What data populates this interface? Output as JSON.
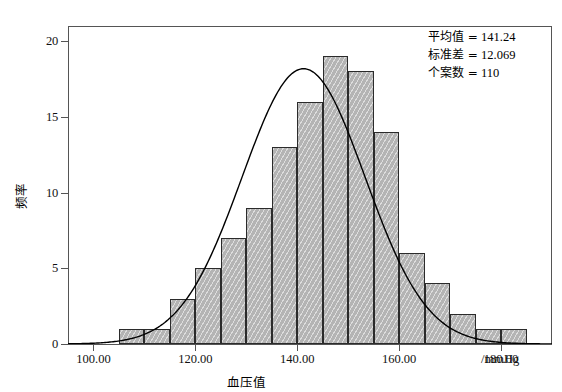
{
  "chart_data": {
    "type": "bar",
    "title": "",
    "subtitle": "",
    "xlabel": "血压值",
    "x_unit_label": "/mmHg",
    "ylabel": "频率",
    "xlim": [
      95,
      190
    ],
    "ylim": [
      0,
      21
    ],
    "grid": false,
    "x_ticks": [
      "100.00",
      "120.00",
      "140.00",
      "160.00",
      "180.00"
    ],
    "x_tick_values": [
      100,
      120,
      140,
      160,
      180
    ],
    "y_ticks": [
      "0",
      "5",
      "10",
      "15",
      "20"
    ],
    "y_tick_values": [
      0,
      5,
      10,
      15,
      20
    ],
    "bin_width": 5,
    "bin_edges": [
      105,
      110,
      115,
      120,
      125,
      130,
      135,
      140,
      145,
      150,
      155,
      160,
      165,
      170,
      175,
      180,
      185
    ],
    "categories": [
      "105-110",
      "110-115",
      "115-120",
      "120-125",
      "125-130",
      "130-135",
      "135-140",
      "140-145",
      "145-150",
      "150-155",
      "155-160",
      "160-165",
      "165-170",
      "170-175",
      "175-180",
      "180-185"
    ],
    "values": [
      1,
      1,
      3,
      5,
      7,
      9,
      13,
      16,
      19,
      18,
      14,
      6,
      4,
      2,
      1,
      1
    ],
    "bar_fill_color": "#b4b4b4",
    "bar_edge_color": "#2b2b2b",
    "curve": {
      "type": "normal",
      "mean": 141.24,
      "sd": 12.069,
      "n": 110,
      "scale_bin_width": 5,
      "peak_value": 18.2,
      "color": "#000000"
    },
    "legend_position": "top-right",
    "annotations": [
      "平均值 = 141.24",
      "标准差 = 12.069",
      "个案数 = 110"
    ]
  },
  "stats": {
    "mean_label": "平均值 =",
    "mean_value": "141.24",
    "sd_label": "标准差 =",
    "sd_value": "12.069",
    "n_label": "个案数 =",
    "n_value": "110"
  },
  "axes": {
    "y_title": "频率",
    "x_title": "血压值",
    "x_unit": "/mmHg"
  }
}
